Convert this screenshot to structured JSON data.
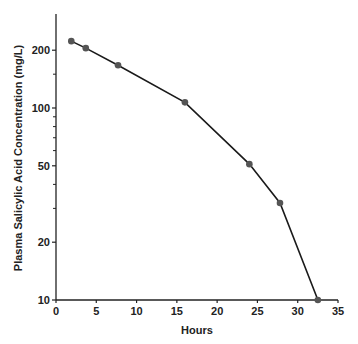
{
  "chart_data": {
    "type": "line",
    "title": "",
    "xlabel": "Hours",
    "ylabel": "Plasma Salicylic Acid Concentration (mg/L)",
    "xscale": "linear",
    "yscale": "log",
    "xlim": [
      0,
      35
    ],
    "ylim": [
      10,
      300
    ],
    "x_ticks": [
      0,
      5,
      10,
      15,
      20,
      25,
      30,
      35
    ],
    "y_ticks": [
      10,
      20,
      50,
      100,
      200
    ],
    "y_minor_ticks": [
      30,
      40,
      60,
      70,
      80,
      90,
      150
    ],
    "grid": false,
    "legend": null,
    "series": [
      {
        "name": "Salicylic acid",
        "color": "#1a1a1a",
        "marker_color": "#555555",
        "x": [
          1.9,
          3.7,
          7.7,
          16.0,
          24.0,
          27.8,
          32.5
        ],
        "y": [
          223,
          205,
          167,
          107,
          51,
          32,
          10
        ]
      }
    ]
  }
}
